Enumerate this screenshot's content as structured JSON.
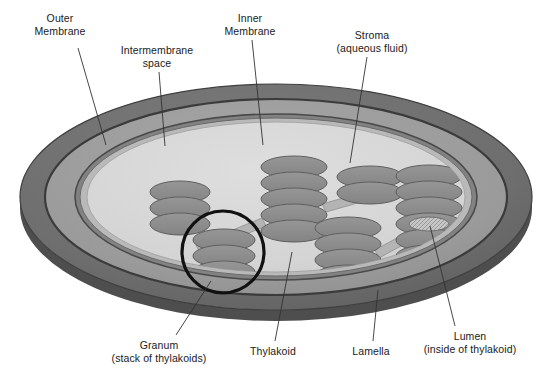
{
  "figure": {
    "background_color": "#ffffff",
    "text_color": "#1a1a1a"
  },
  "palette": {
    "outer_membrane": "#6e6e6e",
    "outer_membrane_dark_edge": "#3f3f3f",
    "intermembrane_space": "#9a9a9a",
    "inner_membrane": "#5a5a5a",
    "stroma": "#d6d6d6",
    "stroma_shadow": "#c2c2c2",
    "thylakoid": "#8c8c8c",
    "thylakoid_edge": "#5f5f5f",
    "lamella": "#b4b4b4",
    "lumen": "#bdbdbd",
    "granum_circle": "#111111",
    "leader_line": "#333333"
  },
  "labels": [
    {
      "id": "outer-membrane",
      "lines": [
        "Outer",
        "Membrane"
      ],
      "text_x": 60,
      "text_y": 12,
      "leader": {
        "x1": 78,
        "y1": 48,
        "x2": 106,
        "y2": 145
      }
    },
    {
      "id": "intermembrane-space",
      "lines": [
        "Intermembrane",
        "space"
      ],
      "text_x": 157,
      "text_y": 44,
      "leader": {
        "x1": 159,
        "y1": 72,
        "x2": 165,
        "y2": 146
      }
    },
    {
      "id": "inner-membrane",
      "lines": [
        "Inner",
        "Membrane"
      ],
      "text_x": 250,
      "text_y": 12,
      "leader": {
        "x1": 252,
        "y1": 40,
        "x2": 263,
        "y2": 145
      }
    },
    {
      "id": "stroma",
      "lines": [
        "Stroma",
        "(aqueous fluid)"
      ],
      "text_x": 372,
      "text_y": 29,
      "leader": {
        "x1": 367,
        "y1": 57,
        "x2": 350,
        "y2": 163
      }
    },
    {
      "id": "granum",
      "lines": [
        "Granum",
        "(stack of thylakoids)"
      ],
      "text_x": 159,
      "text_y": 339,
      "leader": {
        "x1": 176,
        "y1": 335,
        "x2": 211,
        "y2": 281
      }
    },
    {
      "id": "thylakoid",
      "lines": [
        "Thylakoid"
      ],
      "text_x": 273,
      "text_y": 345,
      "leader": {
        "x1": 275,
        "y1": 341,
        "x2": 292,
        "y2": 252
      }
    },
    {
      "id": "lamella",
      "lines": [
        "Lamella"
      ],
      "text_x": 371,
      "text_y": 345,
      "leader": {
        "x1": 373,
        "y1": 341,
        "x2": 378,
        "y2": 290
      }
    },
    {
      "id": "lumen",
      "lines": [
        "Lumen",
        "(inside of thylakoid)"
      ],
      "text_x": 470,
      "text_y": 330,
      "leader": {
        "x1": 455,
        "y1": 326,
        "x2": 430,
        "y2": 226
      }
    }
  ],
  "structure": {
    "outer_membrane_ellipse": {
      "cx": 276,
      "cy": 197,
      "rx": 256,
      "ry": 113
    },
    "intermembrane_ellipse": {
      "cx": 276,
      "cy": 197,
      "rx": 231,
      "ry": 98
    },
    "inner_membrane_ellipse": {
      "cx": 276,
      "cy": 197,
      "rx": 201,
      "ry": 83
    },
    "stroma_ellipse": {
      "cx": 276,
      "cy": 197,
      "rx": 189,
      "ry": 75
    },
    "granum_highlight_circle": {
      "cx": 223,
      "cy": 252,
      "r": 41
    },
    "lumen_marker": {
      "cx": 429,
      "cy": 224,
      "rx": 20,
      "ry": 7
    }
  },
  "grana": [
    {
      "id": "granum-left",
      "disc_rx": 30,
      "disc_ry": 11,
      "discs": [
        {
          "cx": 180,
          "cy": 192
        },
        {
          "cx": 180,
          "cy": 208
        },
        {
          "cx": 180,
          "cy": 224
        }
      ]
    },
    {
      "id": "granum-left-lower",
      "disc_rx": 31,
      "disc_ry": 11,
      "discs": [
        {
          "cx": 224,
          "cy": 240
        },
        {
          "cx": 224,
          "cy": 256
        },
        {
          "cx": 224,
          "cy": 272
        }
      ]
    },
    {
      "id": "granum-center-upper",
      "disc_rx": 33,
      "disc_ry": 11,
      "discs": [
        {
          "cx": 294,
          "cy": 167
        },
        {
          "cx": 294,
          "cy": 183
        },
        {
          "cx": 294,
          "cy": 199
        },
        {
          "cx": 294,
          "cy": 215
        },
        {
          "cx": 294,
          "cy": 231
        }
      ]
    },
    {
      "id": "granum-center-lower",
      "disc_rx": 33,
      "disc_ry": 11,
      "discs": [
        {
          "cx": 348,
          "cy": 228
        },
        {
          "cx": 348,
          "cy": 244
        },
        {
          "cx": 348,
          "cy": 260
        },
        {
          "cx": 348,
          "cy": 276
        }
      ]
    },
    {
      "id": "granum-right-upper",
      "disc_rx": 33,
      "disc_ry": 11,
      "discs": [
        {
          "cx": 370,
          "cy": 177
        },
        {
          "cx": 370,
          "cy": 193
        }
      ]
    },
    {
      "id": "granum-right",
      "disc_rx": 33,
      "disc_ry": 11,
      "discs": [
        {
          "cx": 429,
          "cy": 176
        },
        {
          "cx": 429,
          "cy": 192
        },
        {
          "cx": 429,
          "cy": 208
        },
        {
          "cx": 429,
          "cy": 224
        },
        {
          "cx": 429,
          "cy": 240
        },
        {
          "cx": 429,
          "cy": 256
        }
      ]
    }
  ],
  "lamellae": [
    {
      "id": "lamella-left-center",
      "points": "196,245 262,218 266,226 200,253"
    },
    {
      "id": "lamella-center-right",
      "points": "322,204 392,184 396,192 326,212"
    },
    {
      "id": "lamella-center-lower-right",
      "points": "375,250 406,233 410,241 379,258"
    },
    {
      "id": "lamella-left-lower",
      "points": "192,264 230,282 226,290 188,272"
    }
  ]
}
